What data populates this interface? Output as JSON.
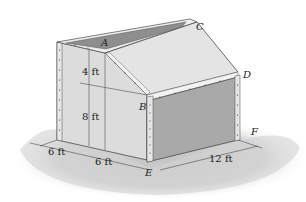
{
  "figure": {
    "points": [
      {
        "id": "A",
        "label": "A"
      },
      {
        "id": "B",
        "label": "B"
      },
      {
        "id": "C",
        "label": "C"
      },
      {
        "id": "D",
        "label": "D"
      },
      {
        "id": "E",
        "label": "E"
      },
      {
        "id": "F",
        "label": "F"
      }
    ],
    "dimensions": [
      {
        "id": "dim-4ft",
        "label": "4 ft"
      },
      {
        "id": "dim-8ft",
        "label": "8 ft"
      },
      {
        "id": "dim-6ft-a",
        "label": "6 ft"
      },
      {
        "id": "dim-6ft-b",
        "label": "6 ft"
      },
      {
        "id": "dim-12ft",
        "label": "12 ft"
      }
    ],
    "colors": {
      "panel_light": "#e2e2e2",
      "panel_mid": "#cfcfcf",
      "panel_dark": "#a8a8a8",
      "opening": "#8e8e8e",
      "shadow": "#d0d0d0",
      "edge": "#4a4a4a"
    }
  }
}
